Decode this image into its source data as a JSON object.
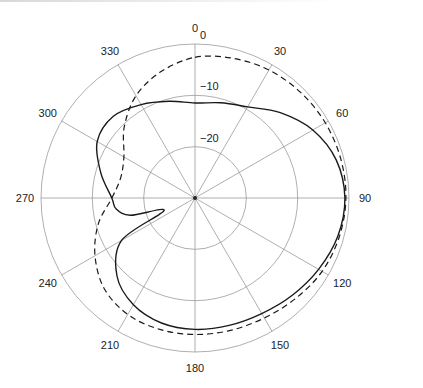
{
  "chart_data": {
    "type": "polar-line",
    "title": "",
    "radial_axis": {
      "unit": "dB",
      "range": [
        -30,
        0
      ],
      "rings": [
        0,
        -10,
        -20
      ],
      "ring_labels": [
        "0",
        "-10",
        "-20"
      ],
      "label_angle_deg": 0
    },
    "angular_axis": {
      "unit": "deg",
      "ticks": [
        0,
        30,
        60,
        90,
        120,
        150,
        180,
        210,
        240,
        270,
        300,
        330
      ],
      "tick_labels": [
        "0",
        "30",
        "60",
        "90",
        "120",
        "150",
        "180",
        "210",
        "240",
        "270",
        "300",
        "330"
      ],
      "direction": "clockwise",
      "zero_at": "top"
    },
    "series": [
      {
        "name": "solid",
        "style": "solid",
        "angles": [
          0,
          15,
          30,
          45,
          60,
          75,
          90,
          105,
          120,
          135,
          150,
          165,
          180,
          195,
          210,
          225,
          240,
          248,
          255,
          262,
          270,
          285,
          300,
          315,
          330,
          345,
          360
        ],
        "values": [
          -11.5,
          -10.8,
          -9.5,
          -6.5,
          -3.5,
          -1.5,
          -0.8,
          -1.2,
          -2.2,
          -3.2,
          -4.0,
          -4.3,
          -4.4,
          -4.8,
          -6.0,
          -8.5,
          -13.5,
          -23.5,
          -17.0,
          -14.5,
          -13.8,
          -11.0,
          -8.0,
          -7.5,
          -9.0,
          -10.5,
          -11.5
        ]
      },
      {
        "name": "dashed",
        "style": "dashed",
        "angles": [
          0,
          15,
          30,
          45,
          60,
          75,
          90,
          105,
          120,
          135,
          150,
          165,
          180,
          195,
          210,
          225,
          240,
          255,
          270,
          285,
          300,
          315,
          330,
          345,
          360
        ],
        "values": [
          -2.6,
          -1.8,
          -1.2,
          -0.9,
          -0.7,
          -0.6,
          -0.6,
          -0.9,
          -1.4,
          -2.3,
          -3.0,
          -3.3,
          -3.4,
          -3.5,
          -3.8,
          -5.0,
          -7.5,
          -10.5,
          -13.8,
          -15.0,
          -14.0,
          -10.5,
          -7.0,
          -4.5,
          -2.6
        ]
      }
    ]
  }
}
